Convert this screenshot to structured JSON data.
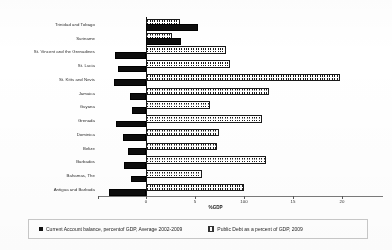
{
  "chart_data": {
    "type": "bar",
    "orientation": "horizontal",
    "title": "",
    "xlabel": "%GDP",
    "ylabel": "",
    "xlim": [
      -6,
      20
    ],
    "xticks": [
      0,
      5,
      10,
      15,
      20
    ],
    "xtick_labels": [
      "0",
      "5",
      "100",
      "15",
      "20"
    ],
    "grid": false,
    "legend_position": "bottom",
    "categories": [
      "Trinidad and Tobago",
      "Suriname",
      "St. Vincent and the Grenadines",
      "St. Lucia",
      "St. Kitts and Nevis",
      "Jamaica",
      "Guyana",
      "Grenada",
      "Dominica",
      "Belize",
      "Barbados",
      "Bahamas, The",
      "Antigua and Barbuda"
    ],
    "series": [
      {
        "name": "Current Account balance, percent of GDP, Average 2002-2009",
        "color": "#111111",
        "values": [
          5.1,
          3.4,
          -3.0,
          -2.7,
          -3.1,
          -1.4,
          -1.2,
          -2.9,
          -2.1,
          -1.6,
          -2.0,
          -1.3,
          -3.6
        ]
      },
      {
        "name": "Public Debt as a percent of GDP, 2009",
        "color": "#ffffff",
        "values": [
          3.3,
          2.4,
          8.0,
          8.4,
          19.6,
          12.3,
          6.3,
          11.6,
          7.2,
          7.0,
          12.0,
          5.5,
          9.8
        ]
      }
    ]
  },
  "axis": {
    "title": "%GDP",
    "ticks": [
      {
        "value": 0,
        "label": "0"
      },
      {
        "value": 5,
        "label": "5"
      },
      {
        "value": 10,
        "label": "100"
      },
      {
        "value": 15,
        "label": "15"
      },
      {
        "value": 20,
        "label": "20"
      }
    ]
  },
  "legend": {
    "items": [
      {
        "marker": "filled-square-icon",
        "label": "Current Account balance, percentof GDP, Average 2002-2009"
      },
      {
        "marker": "hatched-square-icon",
        "label": "Public Debt as a percent of GDP, 2009"
      }
    ]
  }
}
